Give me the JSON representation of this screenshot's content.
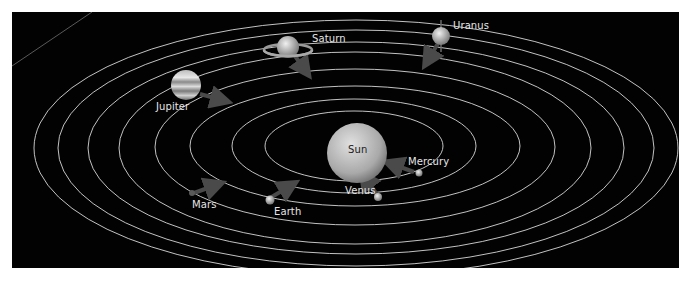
{
  "diagram": {
    "background": "#020202",
    "orbit_color": "#d8d8d8",
    "center": {
      "name": "Sun",
      "label": "Sun"
    },
    "planets": [
      {
        "name": "Mercury",
        "label": "Mercury"
      },
      {
        "name": "Venus",
        "label": "Venus"
      },
      {
        "name": "Earth",
        "label": "Earth"
      },
      {
        "name": "Mars",
        "label": "Mars"
      },
      {
        "name": "Jupiter",
        "label": "Jupiter"
      },
      {
        "name": "Saturn",
        "label": "Saturn"
      },
      {
        "name": "Uranus",
        "label": "Uranus"
      }
    ],
    "orbit_count": 8
  }
}
